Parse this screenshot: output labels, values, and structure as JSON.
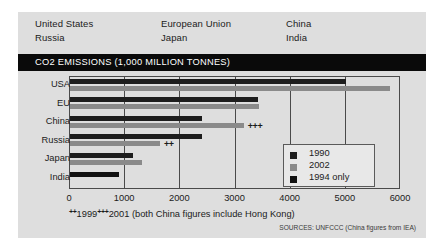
{
  "header": {
    "columns": [
      [
        "United States",
        "Russia"
      ],
      [
        "European Union",
        "Japan"
      ],
      [
        "China",
        "India"
      ]
    ]
  },
  "title": "CO2 EMISSIONS (1,000 MILLION TONNES)",
  "footnote": {
    "mark_a": "++",
    "year_a": "1999",
    "mark_b": "+++",
    "year_b": "2001 (both China figures include Hong Kong)"
  },
  "source": "SOURCES: UNFCCC (China figures from IEA)",
  "colors": {
    "bar_1990": "#1d1d1d",
    "bar_2002": "#8a8a8a",
    "bar_1994": "#111111",
    "panel_background": "#dedede",
    "title_bar": "#0a0a0a",
    "axis": "#4a4a4a"
  },
  "legend": {
    "entries": [
      {
        "label": "1990",
        "color": "#1d1d1d"
      },
      {
        "label": "2002",
        "color": "#8a8a8a"
      },
      {
        "label": "1994 only",
        "color": "#111111"
      }
    ]
  },
  "chart_data": {
    "type": "bar",
    "orientation": "horizontal",
    "title": "CO2 EMISSIONS (1,000 MILLION TONNES)",
    "xlabel": "",
    "ylabel": "",
    "xlim": [
      0,
      6000
    ],
    "xticks": [
      0,
      1000,
      2000,
      3000,
      4000,
      5000,
      6000
    ],
    "xtick_labels": [
      "0",
      "1000",
      "2000",
      "3000",
      "4000",
      "5000",
      "6000"
    ],
    "grid": true,
    "legend_position": "inside-right",
    "categories": [
      "USA",
      "EU",
      "China",
      "Russia",
      "Japan",
      "India"
    ],
    "series": [
      {
        "name": "1990",
        "values": [
          5000,
          3400,
          2400,
          2400,
          1150,
          null
        ]
      },
      {
        "name": "2002",
        "values": [
          5800,
          3420,
          3150,
          1630,
          1300,
          null
        ]
      },
      {
        "name": "1994 only",
        "values": [
          null,
          null,
          null,
          null,
          null,
          880
        ]
      }
    ],
    "annotations": [
      {
        "category": "China",
        "series": "2002",
        "text": "+++"
      },
      {
        "category": "Russia",
        "series": "2002",
        "text": "++"
      }
    ]
  }
}
